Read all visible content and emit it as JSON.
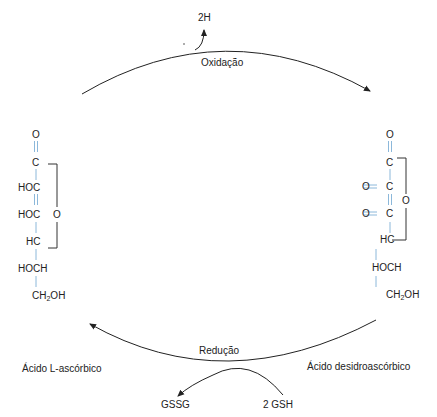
{
  "diagram": {
    "type": "reaction-cycle",
    "colors": {
      "bond": "#7fb0d6",
      "arrow": "#222222",
      "text": "#222222",
      "ring": "#333333"
    },
    "oxidation": {
      "label": "Oxidação",
      "byproduct": "2H"
    },
    "reduction": {
      "label": "Redução",
      "reactant": "2 GSH",
      "product": "GSSG"
    },
    "left_compound": {
      "name": "Ácido L-ascórbico",
      "atoms": {
        "o_top": "O",
        "c1": "C",
        "c2": "HOC",
        "c3": "HOC",
        "c4": "HC",
        "c5": "HOCH",
        "c6_main": "CH",
        "c6_sub": "2",
        "c6_end": "OH",
        "ring_o": "O"
      },
      "bonds": [
        "double",
        "single",
        "double",
        "single",
        "single",
        "single"
      ]
    },
    "right_compound": {
      "name": "Ácido desidroascórbico",
      "atoms": {
        "o_top": "O",
        "c1": "C",
        "c2": "C",
        "c2_o": "O",
        "c3": "C",
        "c3_o": "O",
        "c4": "HC",
        "c5": "HOCH",
        "c6_main": "CH",
        "c6_sub": "2",
        "c6_end": "OH",
        "ring_o": "O"
      },
      "bonds": [
        "double",
        "single",
        "double",
        "single",
        "single",
        "single"
      ],
      "side_bonds": [
        "double",
        "double"
      ]
    }
  }
}
